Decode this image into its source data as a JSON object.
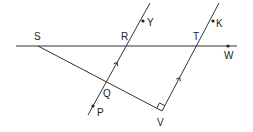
{
  "diagram": {
    "type": "geometry",
    "stroke_color": "#333333",
    "points": {
      "S": {
        "label": "S",
        "x": 38,
        "y": 46,
        "lx": 34,
        "ly": 40
      },
      "R": {
        "label": "R",
        "x": 129,
        "y": 46,
        "lx": 121,
        "ly": 40
      },
      "T": {
        "label": "T",
        "x": 199,
        "y": 46,
        "lx": 193,
        "ly": 40
      },
      "W": {
        "label": "W",
        "x": 228,
        "y": 46,
        "lx": 224,
        "ly": 59
      },
      "Y": {
        "label": "Y",
        "x": 143,
        "y": 21,
        "lx": 147,
        "ly": 26
      },
      "K": {
        "label": "K",
        "x": 213,
        "y": 21,
        "lx": 216,
        "ly": 27
      },
      "Q": {
        "label": "Q",
        "x": 106,
        "y": 84,
        "lx": 103,
        "ly": 97
      },
      "P": {
        "label": "P",
        "x": 93,
        "y": 106,
        "lx": 97,
        "ly": 116
      },
      "V": {
        "label": "V",
        "x": 162,
        "y": 111,
        "lx": 157,
        "ly": 126
      }
    },
    "lines": [
      {
        "name": "line-SW",
        "x1": 16,
        "y1": 46,
        "x2": 237,
        "y2": 46
      },
      {
        "name": "line-PY",
        "x1": 88,
        "y1": 115,
        "x2": 150,
        "y2": 3
      },
      {
        "name": "line-VK",
        "x1": 162,
        "y1": 111,
        "x2": 219,
        "y2": 3
      },
      {
        "name": "segment-SV",
        "x1": 38,
        "y1": 46,
        "x2": 162,
        "y2": 111
      }
    ],
    "parallel_marks": [
      "PY",
      "VK"
    ],
    "right_angle_at": "V"
  }
}
